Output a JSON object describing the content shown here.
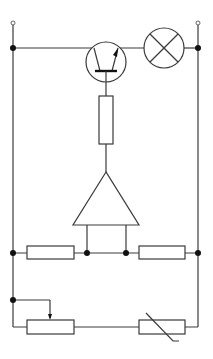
{
  "diagram": {
    "type": "electronic-circuit-schematic",
    "title": "",
    "colors": {
      "line": "#3a3a3a",
      "node": "#111111",
      "background": "#ffffff"
    },
    "components": [
      {
        "id": "terminal-left",
        "kind": "open-terminal"
      },
      {
        "id": "terminal-right",
        "kind": "open-terminal"
      },
      {
        "id": "transistor",
        "kind": "npn-transistor"
      },
      {
        "id": "lamp",
        "kind": "lamp"
      },
      {
        "id": "base-resistor",
        "kind": "resistor"
      },
      {
        "id": "amplifier",
        "kind": "amplifier-triangle"
      },
      {
        "id": "bridge-resistor-left",
        "kind": "resistor"
      },
      {
        "id": "bridge-resistor-right",
        "kind": "resistor"
      },
      {
        "id": "potentiometer",
        "kind": "variable-resistor"
      },
      {
        "id": "thermistor",
        "kind": "thermistor"
      }
    ],
    "labels": []
  }
}
